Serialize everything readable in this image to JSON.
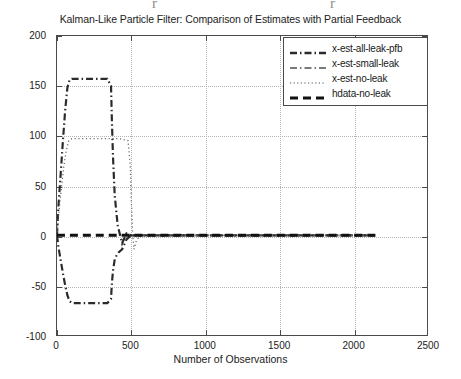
{
  "chart_data": {
    "type": "line",
    "title": "Kalman-Like Particle Filter: Comparison of Estimates with Partial Feedback",
    "xlabel": "Number of Observations",
    "ylabel": "State-estimate",
    "xlim": [
      0,
      2500
    ],
    "ylim": [
      -100,
      200
    ],
    "xticks": [
      0,
      500,
      1000,
      1500,
      2000,
      2500
    ],
    "yticks": [
      -100,
      -50,
      0,
      50,
      100,
      150,
      200
    ],
    "grid": true,
    "legend_position": "top-right",
    "series": [
      {
        "name": "x-est-all-leak-pfb",
        "style": "dash-dot",
        "color": "#2b2b2b",
        "width": 2.2,
        "x": [
          0,
          10,
          25,
          40,
          55,
          70,
          85,
          100,
          160,
          250,
          340,
          365,
          370,
          378,
          390,
          410,
          440,
          470,
          500,
          560,
          700,
          900,
          1200,
          1500,
          1800,
          2000,
          2150
        ],
        "y": [
          0,
          30,
          62,
          95,
          125,
          148,
          156,
          157,
          157,
          157,
          157,
          150,
          120,
          80,
          40,
          10,
          -8,
          2,
          0,
          0,
          0,
          0,
          0,
          0,
          0,
          0,
          0
        ]
      },
      {
        "name": "x-est-small-leak",
        "style": "dash-dot",
        "color": "#2b2b2b",
        "width": 2.2,
        "x": [
          0,
          10,
          25,
          40,
          55,
          70,
          85,
          100,
          160,
          250,
          340,
          365,
          370,
          378,
          390,
          410,
          440,
          470,
          500,
          560,
          700,
          900,
          1200,
          1500,
          1800,
          2000,
          2150
        ],
        "y": [
          0,
          -12,
          -25,
          -38,
          -50,
          -60,
          -66,
          -68,
          -68,
          -68,
          -68,
          -64,
          -50,
          -36,
          -24,
          -18,
          -14,
          -4,
          0,
          0,
          0,
          0,
          0,
          0,
          0,
          0,
          0
        ]
      },
      {
        "name": "x-est-no-leak",
        "style": "dotted",
        "color": "#6e6e6e",
        "width": 1.3,
        "x": [
          0,
          12,
          28,
          45,
          62,
          80,
          100,
          160,
          250,
          340,
          420,
          480,
          495,
          502,
          510,
          520,
          535,
          560,
          620,
          800,
          1100,
          1500,
          1900,
          2150
        ],
        "y": [
          0,
          22,
          45,
          68,
          85,
          95,
          97,
          97,
          97,
          97,
          97,
          95,
          70,
          35,
          5,
          -14,
          -6,
          0,
          0,
          0,
          0,
          0,
          0,
          0
        ]
      },
      {
        "name": "hdata-no-leak",
        "style": "dashed",
        "color": "#111111",
        "width": 3.0,
        "x": [
          0,
          250,
          500,
          750,
          1000,
          1250,
          1500,
          1750,
          2000,
          2150
        ],
        "y": [
          0,
          0,
          0,
          0,
          0,
          0,
          0,
          0,
          0,
          0
        ]
      }
    ]
  },
  "legend": {
    "entries": [
      {
        "label": "x-est-all-leak-pfb",
        "sample": "dash-dot-thick"
      },
      {
        "label": "x-est-small-leak",
        "sample": "dash-dot-thin"
      },
      {
        "label": "x-est-no-leak",
        "sample": "dotted"
      },
      {
        "label": "hdata-no-leak",
        "sample": "dashed-thick"
      }
    ]
  },
  "artifacts": {
    "left_mark": "r",
    "right_mark": "r"
  }
}
